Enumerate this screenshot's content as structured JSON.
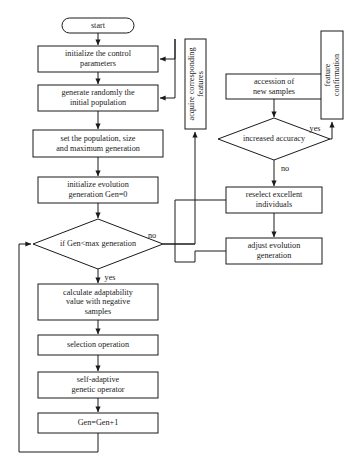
{
  "diagram": {
    "title_fragment": "",
    "nodes": {
      "start": "start",
      "init_control": "initialize the control parameters",
      "init_control_l1": "initialize the control",
      "init_control_l2": "parameters",
      "generate_random": "generate randomly the initial population",
      "generate_random_l1": "generate randomly the",
      "generate_random_l2": "initial population",
      "set_population": "set the population, size and maximum generation",
      "set_population_l1": "set the population, size",
      "set_population_l2": "and maximum generation",
      "init_evolution": "initialize evolution generation Gen=0",
      "init_evolution_l1": "initialize evolution",
      "init_evolution_l2": "generation Gen=0",
      "gen_decision": "if Gen<max generation",
      "calc_adaptability": "calculate adaptability value with negative samples",
      "calc_adaptability_l1": "calculate adaptability",
      "calc_adaptability_l2": "value with negative",
      "calc_adaptability_l3": "samples",
      "selection_operation": "selection operation",
      "genetic_operator": "self-adaptive genetic operator",
      "genetic_operator_l1": "self-adaptive",
      "genetic_operator_l2": "genetic operator",
      "gen_increment": "Gen=Gen+1",
      "acquire_features": "acquire corresponding features",
      "acquire_features_l1": "acquire corresponding",
      "acquire_features_l2": "features",
      "accession_samples": "accession of new samples",
      "accession_samples_l1": "accession of",
      "accession_samples_l2": "new samples",
      "accuracy_decision": "increased accuracy",
      "reselect_individuals": "reselect excellent individuals",
      "reselect_individuals_l1": "reselect excellent",
      "reselect_individuals_l2": "individuals",
      "adjust_evolution": "adjust evolution generation",
      "adjust_evolution_l1": "adjust evolution",
      "adjust_evolution_l2": "generation",
      "feature_confirmation": "feature confirmation",
      "feature_confirmation_l1": "feature",
      "feature_confirmation_l2": "confirmation"
    },
    "edge_labels": {
      "gen_no": "no",
      "gen_yes": "yes",
      "accuracy_yes": "yes",
      "accuracy_no": "no"
    },
    "colors": {
      "stroke": "#1a1a1a",
      "fill": "#ffffff",
      "background": "#ffffff"
    }
  }
}
